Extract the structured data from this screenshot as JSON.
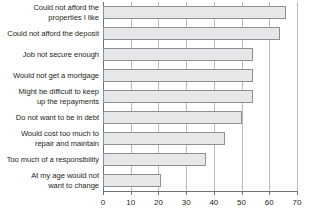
{
  "chart_data": {
    "type": "bar",
    "orientation": "horizontal",
    "title": "",
    "subtitle": "",
    "xlabel": "",
    "ylabel": "",
    "xlim": [
      0,
      70
    ],
    "xticks": [
      0,
      10,
      20,
      30,
      40,
      50,
      60,
      70
    ],
    "xtick_labels": [
      "0",
      "10",
      "20",
      "30",
      "40",
      "50",
      "60",
      "70"
    ],
    "grid": "vertical",
    "legend": "none",
    "bar_fill_color": "#e6e7e8",
    "bar_border_color": "#8c9093",
    "gridline_color": "#b9bcbe",
    "axis_color": "#6e7275",
    "categories": [
      "Could not afford the properties I like",
      "Could not afford the deposit",
      "Job not secure enough",
      "Would not get a mortgage",
      "Might be difficult to keep up the repayments",
      "Do not want to be in debt",
      "Would cost too much to repair and maintain",
      "Too much of a responsibility",
      "At my age would not want to change"
    ],
    "category_lines": [
      [
        "Could not afford the",
        "properties I like"
      ],
      [
        "Could not afford the deposit"
      ],
      [
        "Job not secure enough"
      ],
      [
        "Would not get a mortgage"
      ],
      [
        "Might be difficult to keep",
        "up the repayments"
      ],
      [
        "Do not want to be in debt"
      ],
      [
        "Would cost too much to",
        "repair and maintain"
      ],
      [
        "Too much of a responsibility"
      ],
      [
        "At my age would not",
        "want to change"
      ]
    ],
    "values": [
      66,
      64,
      54,
      54,
      54,
      50,
      44,
      37,
      21
    ]
  }
}
